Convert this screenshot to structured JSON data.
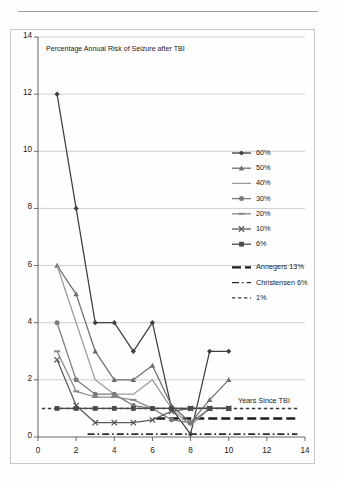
{
  "page": {
    "rule_label": "page-top-rule"
  },
  "chart_data": {
    "type": "line",
    "title": "Percentage Annual Risk of Seizure after TBI",
    "xlabel": "Years Since TBI",
    "ylabel": "",
    "xlim": [
      0,
      14
    ],
    "ylim": [
      0,
      14
    ],
    "xticks": [
      0,
      2,
      4,
      6,
      8,
      10,
      12,
      14
    ],
    "yticks": [
      0,
      2,
      4,
      6,
      8,
      10,
      12,
      14
    ],
    "grid": true,
    "legend_position": "right",
    "x": [
      1,
      2,
      3,
      4,
      5,
      6,
      7,
      8,
      9,
      10
    ],
    "series": [
      {
        "name": "60%",
        "marker": "diamond",
        "color": "#3f3f3f",
        "values": [
          12,
          8,
          4,
          4,
          3,
          4,
          1,
          0.1,
          3,
          3
        ]
      },
      {
        "name": "50%",
        "marker": "triangle",
        "color": "#6e6e6e",
        "values": [
          6,
          5,
          3,
          2,
          2,
          2.5,
          1.1,
          0.5,
          1.3,
          2
        ]
      },
      {
        "name": "40%",
        "marker": "none",
        "color": "#9a9a9a",
        "values": [
          6,
          4,
          2,
          1.5,
          1.5,
          2,
          1,
          0.4,
          1,
          1
        ]
      },
      {
        "name": "30%",
        "marker": "circle",
        "color": "#7b7b7b",
        "values": [
          4,
          2,
          1.5,
          1.5,
          1.1,
          1,
          0.6,
          0.5,
          1,
          1
        ]
      },
      {
        "name": "20%",
        "marker": "dash",
        "color": "#888888",
        "values": [
          3,
          1.6,
          1.4,
          1.4,
          1.3,
          1,
          1,
          1,
          1,
          1
        ]
      },
      {
        "name": "10%",
        "marker": "x",
        "color": "#5b5b5b",
        "values": [
          2.7,
          1.1,
          0.5,
          0.5,
          0.5,
          0.6,
          0.9,
          1,
          1,
          1
        ]
      },
      {
        "name": "6%",
        "marker": "square",
        "color": "#4a4a4a",
        "values": [
          1,
          1,
          1,
          1,
          1,
          1,
          1,
          1,
          1,
          1
        ]
      }
    ],
    "reference_lines": [
      {
        "name": "Annegers 13%",
        "value": 0.65,
        "style": "long-dash",
        "color": "#1d1d1d",
        "x_start": 6.2,
        "x_end": 13.6
      },
      {
        "name": "Christensen 6%",
        "value": 0.1,
        "style": "dash-dot",
        "color": "#2b2b2b",
        "x_start": 2.6,
        "x_end": 13.6
      },
      {
        "name": "1%",
        "value": 1,
        "style": "short-dash",
        "color": "#3a3a3a",
        "x_start": 0.2,
        "x_end": 13.6
      }
    ],
    "legend_entries": [
      {
        "label": "60%",
        "marker": "diamond",
        "style": "solid",
        "color": "#3f3f3f"
      },
      {
        "label": "50%",
        "marker": "triangle",
        "style": "solid",
        "color": "#6e6e6e"
      },
      {
        "label": "40%",
        "marker": "none",
        "style": "solid",
        "color": "#9a9a9a"
      },
      {
        "label": "30%",
        "marker": "circle",
        "style": "solid",
        "color": "#7b7b7b"
      },
      {
        "label": "20%",
        "marker": "dash",
        "style": "solid",
        "color": "#888888"
      },
      {
        "label": "10%",
        "marker": "x",
        "style": "solid",
        "color": "#5b5b5b"
      },
      {
        "label": "6%",
        "marker": "square",
        "style": "solid",
        "color": "#4a4a4a"
      },
      {
        "label": "Annegers 13%",
        "marker": "none",
        "style": "long-dash",
        "color": "#1d1d1d"
      },
      {
        "label": "Christensen 6%",
        "marker": "none",
        "style": "dash-dot",
        "color": "#2b2b2b"
      },
      {
        "label": "1%",
        "marker": "none",
        "style": "short-dash",
        "color": "#3a3a3a"
      }
    ]
  }
}
